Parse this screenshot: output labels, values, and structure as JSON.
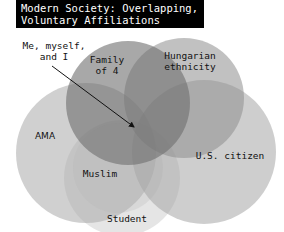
{
  "title": {
    "line1": "Modern Society: Overlapping,",
    "line2": "Voluntary Affiliations"
  },
  "callout": {
    "line1": "Me, myself,",
    "line2": "and I"
  },
  "circles": [
    {
      "id": "family",
      "label_line1": "Family",
      "label_line2": "of 4"
    },
    {
      "id": "hungarian",
      "label_line1": "Hungarian",
      "label_line2": "ethnicity"
    },
    {
      "id": "ama",
      "label_line1": "AMA"
    },
    {
      "id": "muslim",
      "label_line1": "Muslim"
    },
    {
      "id": "us-citizen",
      "label_line1": "U.S. citizen"
    },
    {
      "id": "student",
      "label_line1": "Student"
    }
  ],
  "colors": {
    "title_bg": "#000000",
    "title_fg": "#ffffff",
    "circle_fill": "#7a7a7a"
  }
}
